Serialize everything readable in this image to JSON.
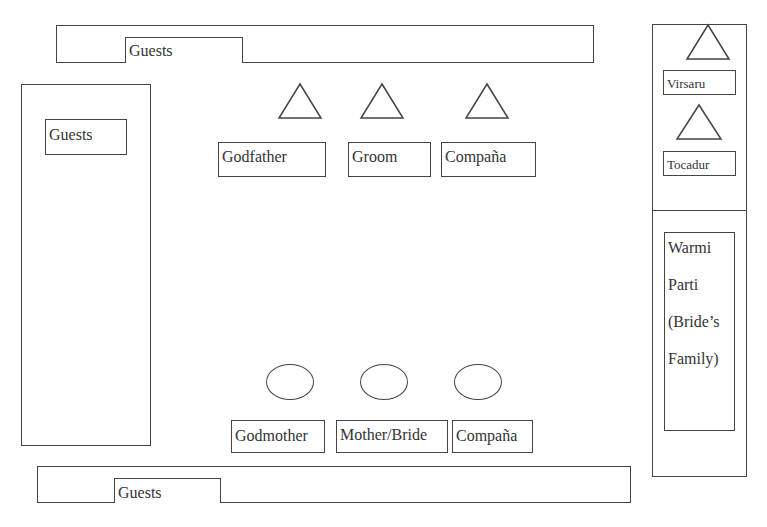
{
  "diagram": {
    "title": "",
    "top_guests_area": {
      "label": "Guests"
    },
    "left_guests_area": {
      "label": "Guests"
    },
    "bottom_guests_area": {
      "label": "Guests"
    },
    "men_row": {
      "shape": "triangle",
      "seats": [
        {
          "label": "Godfather"
        },
        {
          "label": "Groom"
        },
        {
          "label": "Compaña"
        }
      ]
    },
    "women_row": {
      "shape": "circle",
      "seats": [
        {
          "label": "Godmother"
        },
        {
          "label": "Mother/Bride"
        },
        {
          "label": "Compaña"
        }
      ]
    },
    "right_column": {
      "musicians": [
        {
          "label": "Virsaru",
          "shape": "triangle"
        },
        {
          "label": "Tocadur",
          "shape": "triangle"
        }
      ],
      "brides_family": {
        "lines": [
          "Warmi",
          "Parti",
          "(Bride’s",
          "Family)"
        ]
      }
    },
    "legend_shapes": {
      "triangle": "male",
      "circle": "female"
    },
    "colors": {
      "stroke": "#444444",
      "text": "#333333",
      "background": "#ffffff"
    }
  }
}
